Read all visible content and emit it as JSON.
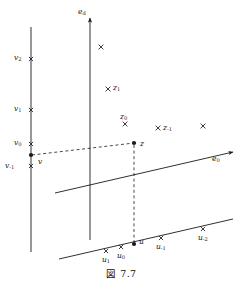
{
  "figure": {
    "caption": "図 7.7",
    "background_color": "#ffffff",
    "ink_color": "#1a1a1a",
    "width": 243,
    "height": 287
  },
  "axes": [
    {
      "name": "e_d-axis",
      "label": "e",
      "sub": "d",
      "label_x": 78,
      "label_y": 8,
      "x1": 90,
      "y1": 240,
      "x2": 90,
      "y2": 18,
      "arrow": true,
      "dashed": false
    },
    {
      "name": "e_0-axis",
      "label": "e",
      "sub": "0",
      "label_x": 212,
      "label_y": 155,
      "x1": 55,
      "y1": 193,
      "x2": 233,
      "y2": 152,
      "arrow": true,
      "dashed": false
    },
    {
      "name": "v-line",
      "label": "",
      "sub": "",
      "label_x": 0,
      "label_y": 0,
      "x1": 31,
      "y1": 27,
      "x2": 31,
      "y2": 252,
      "arrow": false,
      "dashed": false
    },
    {
      "name": "u-line",
      "label": "",
      "sub": "",
      "label_x": 0,
      "label_y": 0,
      "x1": 59,
      "y1": 259,
      "x2": 233,
      "y2": 219,
      "arrow": false,
      "dashed": false
    }
  ],
  "dashed_lines": [
    {
      "name": "v-to-z-dashed",
      "x1": 32,
      "y1": 155,
      "x2": 134,
      "y2": 143
    },
    {
      "name": "z-to-u-dashed",
      "x1": 134,
      "y1": 145,
      "x2": 134,
      "y2": 243
    }
  ],
  "tick_marks": [
    {
      "name": "tick-v2",
      "x": 31,
      "y": 59,
      "kind": "cross"
    },
    {
      "name": "tick-v1",
      "x": 31,
      "y": 110,
      "kind": "cross"
    },
    {
      "name": "tick-v0",
      "x": 31,
      "y": 144,
      "kind": "cross"
    },
    {
      "name": "tick-v-minus-1",
      "x": 31,
      "y": 166,
      "kind": "cross"
    },
    {
      "name": "tick-u1",
      "x": 106,
      "y": 251,
      "kind": "cross"
    },
    {
      "name": "tick-u0",
      "x": 121,
      "y": 247,
      "kind": "cross"
    },
    {
      "name": "tick-u-minus-1",
      "x": 161,
      "y": 238,
      "kind": "cross"
    },
    {
      "name": "tick-u-minus-2",
      "x": 203,
      "y": 229,
      "kind": "cross"
    }
  ],
  "scatter_points": [
    {
      "name": "x-mark-top",
      "x": 101,
      "y": 47
    },
    {
      "name": "x-mark-z1",
      "x": 108,
      "y": 89
    },
    {
      "name": "x-mark-z0",
      "x": 125,
      "y": 124
    },
    {
      "name": "x-mark-z-minus-1",
      "x": 158,
      "y": 128
    },
    {
      "name": "x-mark-right",
      "x": 203,
      "y": 126
    }
  ],
  "filled_points": [
    {
      "name": "point-v",
      "x": 31,
      "y": 155
    },
    {
      "name": "point-z",
      "x": 134,
      "y": 143
    },
    {
      "name": "point-u",
      "x": 134,
      "y": 244
    }
  ],
  "labels": [
    {
      "name": "label-v2",
      "text": "v",
      "sub": "2",
      "x": 14,
      "y": 54
    },
    {
      "name": "label-v1",
      "text": "v",
      "sub": "1",
      "x": 14,
      "y": 105
    },
    {
      "name": "label-v0",
      "text": "v",
      "sub": "0",
      "x": 14,
      "y": 139
    },
    {
      "name": "label-v-minus-1",
      "text": "v",
      "sub": "-1",
      "x": 5,
      "y": 162
    },
    {
      "name": "label-v",
      "text": "v",
      "sub": "",
      "x": 38,
      "y": 158
    },
    {
      "name": "label-z1",
      "text": "z",
      "sub": "1",
      "x": 113,
      "y": 84
    },
    {
      "name": "label-z0",
      "text": "z",
      "sub": "0",
      "x": 120,
      "y": 113
    },
    {
      "name": "label-z",
      "text": "z",
      "sub": "",
      "x": 140,
      "y": 140
    },
    {
      "name": "label-z-minus-1",
      "text": "z",
      "sub": "-1",
      "x": 163,
      "y": 124
    },
    {
      "name": "label-u1",
      "text": "u",
      "sub": "1",
      "x": 102,
      "y": 256
    },
    {
      "name": "label-u0",
      "text": "u",
      "sub": "0",
      "x": 117,
      "y": 252
    },
    {
      "name": "label-u",
      "text": "u",
      "sub": "",
      "x": 139,
      "y": 238
    },
    {
      "name": "label-u-minus-1",
      "text": "u",
      "sub": "-1",
      "x": 156,
      "y": 243
    },
    {
      "name": "label-u-minus-2",
      "text": "u",
      "sub": "-2",
      "x": 198,
      "y": 234
    }
  ]
}
